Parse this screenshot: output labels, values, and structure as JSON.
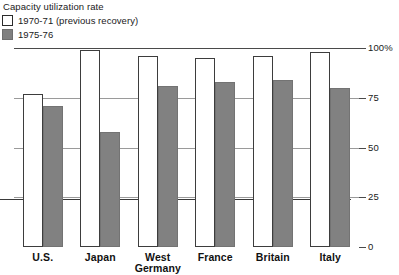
{
  "legend": {
    "title": "Capacity utilization rate",
    "items": [
      {
        "label": "1970-71 (previous recovery)",
        "swatch": "white",
        "color": "#ffffff"
      },
      {
        "label": "1975-76",
        "swatch": "gray",
        "color": "#818181"
      }
    ]
  },
  "axis": {
    "y_ticks": [
      "100%",
      "75",
      "50",
      "25",
      "0"
    ],
    "y_values": [
      100,
      75,
      50,
      25,
      0
    ]
  },
  "chart_data": {
    "type": "bar",
    "title": "Capacity utilization rate",
    "xlabel": "",
    "ylabel": "",
    "ylim": [
      0,
      100
    ],
    "grid": true,
    "legend_position": "top-left",
    "categories": [
      "U.S.",
      "Japan",
      "West Germany",
      "France",
      "Britain",
      "Italy"
    ],
    "category_lines": [
      [
        "U.S.",
        ""
      ],
      [
        "Japan",
        ""
      ],
      [
        "West",
        "Germany"
      ],
      [
        "France",
        ""
      ],
      [
        "Britain",
        ""
      ],
      [
        "Italy",
        ""
      ]
    ],
    "series": [
      {
        "name": "1970-71 (previous recovery)",
        "color": "#ffffff",
        "values": [
          77,
          99,
          96,
          95,
          96,
          98
        ]
      },
      {
        "name": "1975-76",
        "color": "#818181",
        "values": [
          71,
          58,
          81,
          83,
          84,
          80
        ]
      }
    ],
    "tick_labels": [
      "100%",
      "75",
      "50",
      "25",
      "0"
    ]
  }
}
